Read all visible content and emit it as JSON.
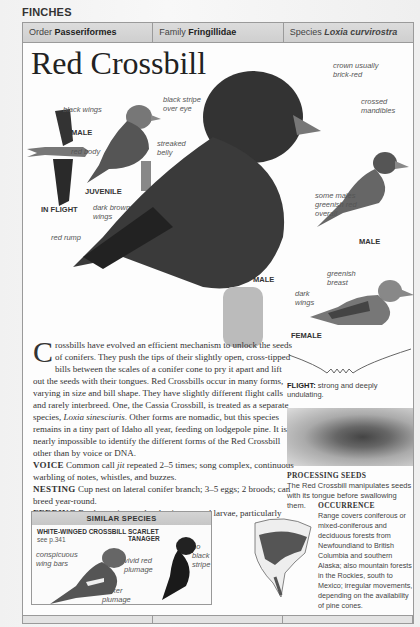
{
  "section": "FINCHES",
  "taxonomy": {
    "order_label": "Order",
    "order_value": "Passeriformes",
    "family_label": "Family",
    "family_value": "Fringillidae",
    "species_label": "Species",
    "species_value": "Loxia curvirostra"
  },
  "title": "Red Crossbill",
  "labels": {
    "black_wings": "black wings",
    "red_body": "red body",
    "streaked_belly": "streaked belly",
    "black_stripe": "black stripe over eye",
    "crown": "crown usually brick-red",
    "crossed_mandibles": "crossed mandibles",
    "some_males": "some males greenish red overall",
    "dark_brown_wings": "dark brown wings",
    "red_rump": "red rump",
    "greenish_breast": "greenish breast",
    "dark_wings": "dark wings"
  },
  "captions": {
    "male_flight": "MALE",
    "in_flight": "IN FLIGHT",
    "juvenile": "JUVENILE",
    "male_main": "MALE",
    "male_right": "MALE",
    "female": "FEMALE"
  },
  "body": {
    "dropcap": "C",
    "intro": "rossbills have evolved an efficient mechanism to unlock the seeds of conifers. They push the tips of their slightly open, cross-tipped bills between the scales of a conifer cone to pry it apart and lift out the seeds with their tongues. Red Crossbills occur in many forms, varying in size and bill shape. They have slightly different flight calls and rarely interbreed. One, the Cassia Crossbill, is treated as a separate species, ",
    "intro_species": "Loxia sinesciuris",
    "intro_end": ". Other forms are nomadic, but this species remains in a tiny part of Idaho all year, feeding on lodgepole pine. It is nearly impossible to identify the different forms of the Red Crossbill other than by voice or DNA.",
    "voice_label": "VOICE",
    "voice_pre": "Common call ",
    "voice_call": "jit",
    "voice_post": " repeated 2–5 times; song complex, continuous warbling of notes, whistles, and buzzes.",
    "nesting_label": "NESTING",
    "nesting_text": "Cup nest on lateral conifer branch; 3–5 eggs; 2 broods; can breed year-round.",
    "feeding_label": "FEEDING",
    "feeding_text": "Feeds on pine seeds; also insects and larvae, particularly aphids; also other seeds."
  },
  "flight": {
    "label": "FLIGHT:",
    "text": "strong and deeply undulating."
  },
  "processing": {
    "title": "PROCESSING SEEDS",
    "text": "The Red Crossbill manipulates seeds with its tongue before swallowing them."
  },
  "similar": {
    "heading": "SIMILAR SPECIES",
    "species1_name": "WHITE-WINGED CROSSBILL",
    "species1_ref": "see p.341",
    "species1_label1": "conspicuous wing bars",
    "species1_label2": "pinker plumage",
    "species2_name": "SCARLET TANAGER",
    "species2_label1": "vivid red plumage",
    "species2_label2": "no black stripe"
  },
  "occurrence": {
    "title": "OCCURRENCE",
    "text": "Range covers coniferous or mixed-coniferous and deciduous forests from Newfoundland to British Columbia and southern Alaska; also mountain forests in the Rockies, south to Mexico; irregular movements, depending on the availability of pine cones."
  }
}
